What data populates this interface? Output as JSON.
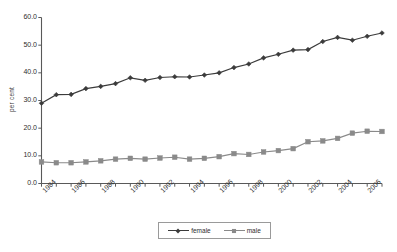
{
  "chart_data": {
    "type": "line",
    "title": "",
    "subtitle": "",
    "xlabel": "",
    "ylabel": "per cent",
    "ylim": [
      0.0,
      60.0
    ],
    "ytick_labels": [
      "60.0",
      "50.0",
      "40.0",
      "30.0",
      "20.0",
      "10.0",
      "0.0"
    ],
    "ytick_values": [
      60.0,
      50.0,
      40.0,
      30.0,
      20.0,
      10.0,
      0.0
    ],
    "grid": false,
    "legend_position": "bottom",
    "x": [
      1984,
      1985,
      1986,
      1987,
      1988,
      1989,
      1990,
      1991,
      1992,
      1993,
      1994,
      1995,
      1996,
      1997,
      1998,
      1999,
      2000,
      2001,
      2002,
      2003,
      2004,
      2005,
      2006,
      2007
    ],
    "xtick_labels": [
      "1984",
      "1986",
      "1988",
      "1990",
      "1992",
      "1994",
      "1996",
      "1998",
      "2000",
      "2002",
      "2004",
      "2006"
    ],
    "xtick_values": [
      1984,
      1986,
      1988,
      1990,
      1992,
      1994,
      1996,
      1998,
      2000,
      2002,
      2004,
      2006
    ],
    "series": [
      {
        "name": "female",
        "color": "#3b3b3b",
        "marker": "diamond",
        "values": [
          29.0,
          32.1,
          32.2,
          34.3,
          35.1,
          36.1,
          38.2,
          37.3,
          38.3,
          38.6,
          38.5,
          39.2,
          40.0,
          41.9,
          43.2,
          45.4,
          46.7,
          48.2,
          48.4,
          51.3,
          52.8,
          51.8,
          53.2,
          54.4
        ]
      },
      {
        "name": "male",
        "color": "#8a8a8a",
        "marker": "square",
        "values": [
          7.8,
          7.5,
          7.5,
          7.8,
          8.2,
          8.8,
          9.1,
          8.8,
          9.2,
          9.5,
          8.8,
          9.1,
          9.7,
          10.8,
          10.5,
          11.4,
          11.9,
          12.6,
          15.1,
          15.4,
          16.3,
          18.2,
          18.9,
          18.8
        ]
      }
    ]
  },
  "legend": {
    "items": [
      {
        "label": "female"
      },
      {
        "label": "male"
      }
    ]
  }
}
